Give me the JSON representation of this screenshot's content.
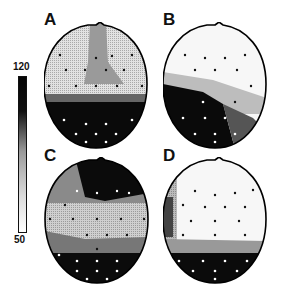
{
  "figure": {
    "panels": [
      {
        "id": "A",
        "label": "A",
        "pattern": "vertical midline ridge of moderate values frontally, high values posteriorly"
      },
      {
        "id": "B",
        "label": "B",
        "pattern": "low values frontally/right, high values left-posterior"
      },
      {
        "id": "C",
        "label": "C",
        "pattern": "high values frontal and posterior, low band centrally"
      },
      {
        "id": "D",
        "label": "D",
        "pattern": "low values over most of scalp, high values posteriorly"
      }
    ],
    "colorbar": {
      "max_label": "120",
      "min_label": "50",
      "max": 120,
      "min": 50
    }
  }
}
